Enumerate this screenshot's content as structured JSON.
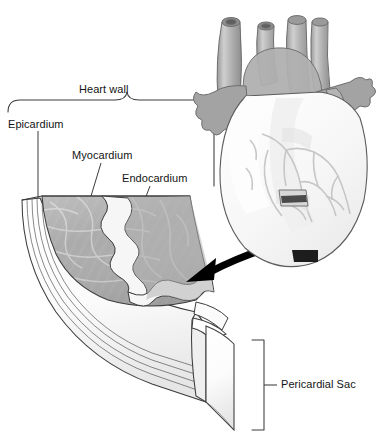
{
  "figure": {
    "labels": {
      "heart_wall": "Heart wall",
      "epicardium": "Epicardium",
      "myocardium": "Myocardium",
      "endocardium": "Endocardium",
      "pericardial_sac": "Pericardial Sac"
    },
    "icons": {
      "callout_arrow": "curved-arrow-icon",
      "heart_inset": "heart-anatomy-icon",
      "heart_wall_brace": "curly-brace-icon",
      "pericardial_bracket": "square-bracket-icon"
    },
    "colors": {
      "background": "#ffffff",
      "outline": "#3c3c3c",
      "myocardium_fill": "#a9a9a9",
      "myocardium_fiber": "#c9c9c9",
      "endocardium_fill": "#f4f4f4",
      "epicardium_fill": "#efefef",
      "pericardium_fill": "#fafafa",
      "heart_vessel": "#a6a6a6",
      "heart_vessel_light": "#c4c4c4",
      "heart_body": "#f7f7f7",
      "heart_coronary": "#cfcfcf",
      "arrow": "#000000",
      "excision_window": "#4a4a4a",
      "label_text": "#141414"
    },
    "layer_order": [
      "Pericardial Sac",
      "Epicardium",
      "Myocardium",
      "Endocardium"
    ]
  }
}
